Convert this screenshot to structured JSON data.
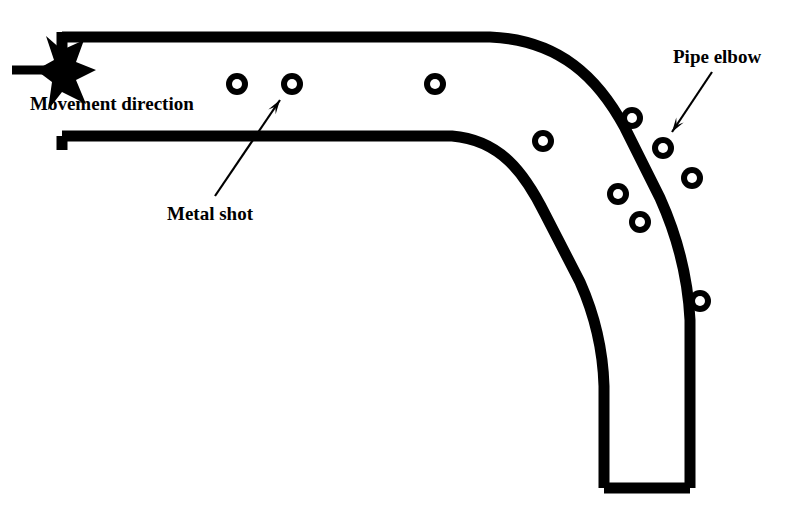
{
  "figure": {
    "kind": "technical-line-diagram",
    "background_color": "#ffffff",
    "ink_color": "#000000",
    "stroke_width_px": 11,
    "width_px": 807,
    "height_px": 510
  },
  "labels": {
    "movement_direction": "Movement direction",
    "metal_shot": "Metal shot",
    "pipe_elbow": "Pipe elbow"
  },
  "label_positions": {
    "movement_direction": {
      "x": 30,
      "y": 110,
      "font_size": 19,
      "anchor": "start"
    },
    "metal_shot": {
      "x": 167,
      "y": 220,
      "font_size": 19,
      "anchor": "start"
    },
    "pipe_elbow": {
      "x": 673,
      "y": 63,
      "font_size": 19,
      "anchor": "start"
    }
  },
  "pipe": {
    "outer_wall_path": "M 62,37 L 490,37 C 560,40 598,78 625,128 L 660,198 C 678,238 688,280 690,320 L 690,488",
    "inner_wall_path": "M 62,136 L 452,136 C 500,140 524,172 545,214 L 580,282 C 596,318 603,352 604,386 L 604,488",
    "left_end_top_cap": {
      "x1": 62,
      "y1": 32,
      "x2": 62,
      "y2": 78
    },
    "left_end_bottom_cap": {
      "x1": 62,
      "y1": 136,
      "x2": 62,
      "y2": 150
    },
    "bottom_cap": {
      "x1": 604,
      "y1": 488,
      "x2": 690,
      "y2": 488
    }
  },
  "movement_arrow": {
    "tail": {
      "x1": 12,
      "y1": 70,
      "x2": 62,
      "y2": 70
    },
    "head_points": "46,36 62,50 84,40 76,62 96,70 76,80 86,104 62,92 48,110 52,82 36,70 54,60",
    "direction": "right"
  },
  "leader_arrows": [
    {
      "name": "metal-shot-leader",
      "from": {
        "x": 215,
        "y": 196
      },
      "to": {
        "x": 280,
        "y": 100
      },
      "head_size": 15
    },
    {
      "name": "pipe-elbow-leader",
      "from": {
        "x": 712,
        "y": 72
      },
      "to": {
        "x": 672,
        "y": 132
      },
      "head_size": 15
    }
  ],
  "metal_shot_particles": {
    "outer_radius": 11,
    "inner_radius": 5,
    "count": 10,
    "positions": [
      {
        "x": 237,
        "y": 84,
        "section": "straight"
      },
      {
        "x": 292,
        "y": 84,
        "section": "straight"
      },
      {
        "x": 435,
        "y": 84,
        "section": "straight"
      },
      {
        "x": 543,
        "y": 141,
        "section": "elbow-inner-wall"
      },
      {
        "x": 632,
        "y": 118,
        "section": "elbow-outer-wall"
      },
      {
        "x": 663,
        "y": 148,
        "section": "elbow-outer-wall"
      },
      {
        "x": 692,
        "y": 178,
        "section": "elbow-outer-wall"
      },
      {
        "x": 618,
        "y": 194,
        "section": "elbow-inner-wall"
      },
      {
        "x": 640,
        "y": 222,
        "section": "elbow-inner-wall"
      },
      {
        "x": 700,
        "y": 301,
        "section": "vertical"
      }
    ]
  }
}
